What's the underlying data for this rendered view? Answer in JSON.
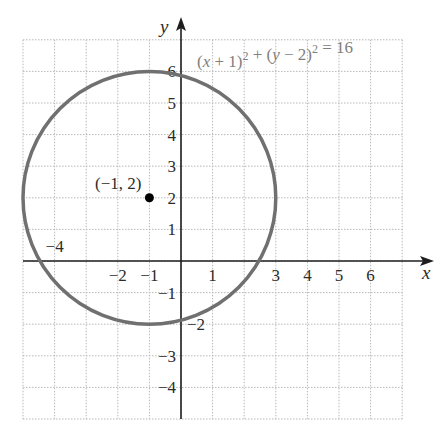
{
  "chart_data": {
    "type": "line",
    "title": "",
    "equation": {
      "parts": [
        {
          "t": "(",
          "i": false
        },
        {
          "t": "x",
          "i": true
        },
        {
          "t": " + 1)",
          "i": false
        },
        {
          "t": "2",
          "sup": true
        },
        {
          "t": " + (",
          "i": false
        },
        {
          "t": "y",
          "i": true
        },
        {
          "t": " − 2)",
          "i": false
        },
        {
          "t": "2",
          "sup": true
        },
        {
          "t": " = 16",
          "i": false
        }
      ],
      "text": "(x + 1)^2 + (y − 2)^2 = 16"
    },
    "xlabel": "x",
    "ylabel": "y",
    "xlim": [
      -5,
      7
    ],
    "ylim": [
      -5,
      7
    ],
    "grid": true,
    "grid_style": "dotted",
    "circle": {
      "center": [
        -1,
        2
      ],
      "radius": 4,
      "color": "#707070"
    },
    "point": {
      "x": -1,
      "y": 2,
      "label": "(−1, 2)"
    },
    "x_ticks": [
      {
        "v": -4,
        "label": "−4",
        "pos": "above"
      },
      {
        "v": -2,
        "label": "−2",
        "pos": "below"
      },
      {
        "v": -1,
        "label": "−1",
        "pos": "below"
      },
      {
        "v": 1,
        "label": "1",
        "pos": "below"
      },
      {
        "v": 3,
        "label": "3",
        "pos": "below"
      },
      {
        "v": 4,
        "label": "4",
        "pos": "below"
      },
      {
        "v": 5,
        "label": "5",
        "pos": "below"
      },
      {
        "v": 6,
        "label": "6",
        "pos": "below"
      }
    ],
    "y_ticks": [
      {
        "v": 6,
        "label": "6",
        "side": "left"
      },
      {
        "v": 5,
        "label": "5",
        "side": "left"
      },
      {
        "v": 4,
        "label": "4",
        "side": "left"
      },
      {
        "v": 3,
        "label": "3",
        "side": "left"
      },
      {
        "v": 2,
        "label": "2",
        "side": "left"
      },
      {
        "v": 1,
        "label": "1",
        "side": "left"
      },
      {
        "v": -1,
        "label": "−1",
        "side": "left"
      },
      {
        "v": -2,
        "label": "−2",
        "side": "right"
      },
      {
        "v": -3,
        "label": "−3",
        "side": "left"
      },
      {
        "v": -4,
        "label": "−4",
        "side": "left"
      }
    ]
  },
  "colors": {
    "grid": "#b8b8b8",
    "axis": "#1e1e1e",
    "circle": "#707070",
    "equation": "#808080",
    "point": "#000000"
  }
}
